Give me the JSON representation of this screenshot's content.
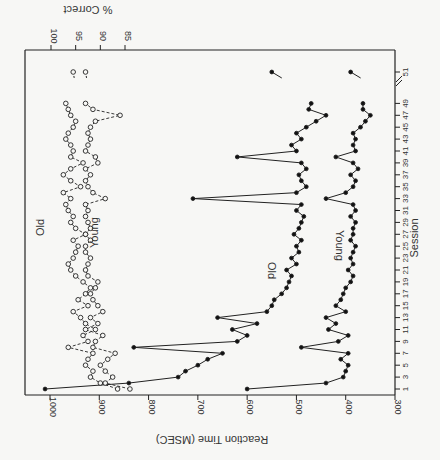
{
  "chart_data": {
    "type": "line",
    "orientation": "rotated-90 (session axis vertical on right, values horizontal)",
    "xlabel": "Session",
    "ylabel_primary": "Reaction Time (MSEC)",
    "ylabel_secondary": "% Correct",
    "session_ticks": [
      "1",
      "3",
      "5",
      "7",
      "9",
      "11",
      "13",
      "15",
      "17",
      "19",
      "21",
      "23",
      "25",
      "27",
      "29",
      "31",
      "33",
      "35",
      "37",
      "39",
      "41",
      "43",
      "45",
      "47",
      "49",
      "51"
    ],
    "rt_ticks": [
      "1000",
      "900",
      "800",
      "700",
      "600",
      "500",
      "400",
      "300"
    ],
    "rt_range": [
      300,
      1000
    ],
    "pct_ticks": [
      "100",
      "95",
      "90",
      "85"
    ],
    "pct_range": [
      85,
      100
    ],
    "axis_break_between": [
      49,
      51
    ],
    "series": [
      {
        "name": "Old",
        "measure": "Reaction Time",
        "style": "solid-filled-circles",
        "x": [
          1,
          2,
          3,
          4,
          5,
          6,
          7,
          8,
          9,
          10,
          11,
          12,
          13,
          14,
          15,
          16,
          17,
          18,
          19,
          20,
          21,
          22,
          23,
          24,
          25,
          26,
          27,
          28,
          29,
          30,
          31,
          32,
          33,
          34,
          35,
          36,
          37,
          38,
          39,
          40,
          41,
          42,
          43,
          44,
          45,
          46,
          47,
          48,
          49,
          51
        ],
        "values": [
          1010,
          840,
          740,
          725,
          700,
          680,
          650,
          830,
          620,
          600,
          630,
          580,
          660,
          560,
          550,
          545,
          530,
          520,
          515,
          510,
          520,
          500,
          510,
          495,
          500,
          490,
          505,
          495,
          490,
          485,
          500,
          490,
          710,
          500,
          480,
          490,
          495,
          480,
          490,
          620,
          500,
          510,
          490,
          500,
          480,
          460,
          440,
          475,
          470,
          550
        ]
      },
      {
        "name": "Young",
        "measure": "Reaction Time",
        "style": "solid-filled-circles",
        "x": [
          1,
          2,
          3,
          4,
          5,
          6,
          7,
          8,
          9,
          10,
          11,
          12,
          13,
          14,
          15,
          16,
          17,
          18,
          19,
          20,
          21,
          22,
          23,
          24,
          25,
          26,
          27,
          28,
          29,
          30,
          31,
          32,
          33,
          34,
          35,
          36,
          37,
          38,
          39,
          40,
          41,
          42,
          43,
          44,
          45,
          46,
          47,
          48,
          49,
          51
        ],
        "values": [
          600,
          440,
          405,
          400,
          395,
          410,
          395,
          490,
          415,
          395,
          435,
          420,
          440,
          400,
          420,
          410,
          405,
          400,
          390,
          385,
          395,
          385,
          390,
          385,
          380,
          390,
          385,
          385,
          380,
          390,
          380,
          385,
          440,
          400,
          385,
          380,
          390,
          375,
          385,
          420,
          380,
          385,
          380,
          385,
          370,
          360,
          350,
          365,
          365,
          390
        ]
      },
      {
        "name": "Old",
        "measure": "% Correct",
        "style": "dashed-open-circles",
        "x": [
          1,
          2,
          3,
          4,
          5,
          6,
          7,
          8,
          9,
          10,
          11,
          12,
          13,
          14,
          15,
          16,
          17,
          18,
          19,
          20,
          21,
          22,
          23,
          24,
          25,
          26,
          27,
          28,
          29,
          30,
          31,
          32,
          33,
          34,
          35,
          36,
          37,
          38,
          39,
          40,
          41,
          42,
          43,
          44,
          45,
          46,
          47,
          48,
          49,
          51
        ],
        "values": [
          86.5,
          90.0,
          92.0,
          91.5,
          93.0,
          92.5,
          91.5,
          96.5,
          92.5,
          93.5,
          91.0,
          93.0,
          94.0,
          95.5,
          92.5,
          94.5,
          93.0,
          92.0,
          93.5,
          95.0,
          96.0,
          96.5,
          95.5,
          95.0,
          94.5,
          95.5,
          93.0,
          95.0,
          96.0,
          95.5,
          96.5,
          97.0,
          96.0,
          97.5,
          94.0,
          96.0,
          97.5,
          96.0,
          93.5,
          96.0,
          95.5,
          96.0,
          97.0,
          96.5,
          95.5,
          95.0,
          96.0,
          96.5,
          97.0,
          95.5
        ]
      },
      {
        "name": "Young",
        "measure": "% Correct",
        "style": "dashed-open-circles",
        "x": [
          1,
          2,
          3,
          4,
          5,
          6,
          7,
          8,
          9,
          10,
          11,
          12,
          13,
          14,
          15,
          16,
          17,
          18,
          19,
          20,
          21,
          22,
          23,
          24,
          25,
          26,
          27,
          28,
          29,
          30,
          31,
          32,
          33,
          34,
          35,
          36,
          37,
          38,
          39,
          40,
          41,
          42,
          43,
          44,
          45,
          46,
          47,
          48,
          49,
          51
        ],
        "values": [
          84.0,
          89.0,
          87.5,
          89.0,
          90.0,
          88.5,
          87.0,
          91.5,
          91.0,
          89.5,
          93.0,
          90.5,
          92.0,
          89.5,
          90.5,
          91.5,
          92.0,
          91.0,
          90.5,
          92.5,
          93.0,
          92.5,
          92.0,
          93.0,
          93.0,
          92.0,
          93.0,
          92.0,
          92.5,
          93.0,
          92.5,
          93.0,
          89.0,
          91.5,
          92.5,
          93.0,
          92.0,
          93.0,
          90.5,
          91.0,
          93.0,
          92.5,
          92.0,
          92.5,
          92.0,
          91.0,
          86.0,
          91.5,
          93.0,
          93.0
        ]
      }
    ],
    "annotations": [
      {
        "text": "Old",
        "near": "RT curve, mid sessions"
      },
      {
        "text": "Young",
        "near": "RT curve, mid sessions"
      },
      {
        "text": "Old",
        "near": "% correct curve"
      },
      {
        "text": "Young",
        "near": "% correct curve"
      }
    ],
    "grid": false,
    "legend": "inline labels"
  },
  "labels": {
    "session": "Session",
    "rt": "Reaction Time (MSEC)",
    "pct": "% Correct",
    "old": "Old",
    "young": "Young"
  }
}
